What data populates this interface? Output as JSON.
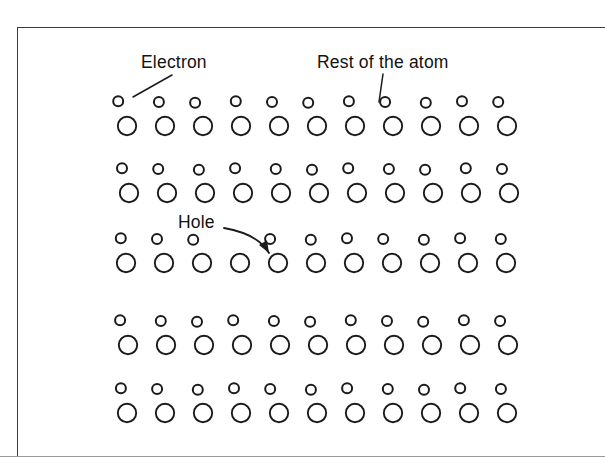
{
  "figure": {
    "kind": "semiconductor-lattice-diagram",
    "background_color": "#ffffff",
    "ink_color": "#1a1a1a",
    "frame_color": "#3a3a3a",
    "frame_bottom_color": "#9a9a9a"
  },
  "labels": {
    "electron": "Electron",
    "rest_of_atom": "Rest of the atom",
    "hole": "Hole"
  },
  "lattice": {
    "columns": 11,
    "rows": 5,
    "electron_radius": 5.0,
    "atom_radius": 9.2,
    "column_step": 38.0,
    "first_atom_x": 127.0,
    "electron_offset_x": -7.0,
    "electron_offset_y": -24.0,
    "row_y": [
      126,
      193,
      263,
      345,
      413
    ],
    "missing_electrons": [
      {
        "row": 2,
        "column": 3
      }
    ],
    "row_x_jitter": [
      0,
      2,
      -1,
      1,
      0
    ]
  },
  "annotations": {
    "electron_leader": {
      "target": "first electron of top row",
      "x1": 172,
      "y1": 75,
      "x2": 133,
      "y2": 97
    },
    "rest_of_atom_leader": {
      "target": "an atom core in the top row",
      "x1": 383,
      "y1": 74,
      "x2": 379,
      "y2": 102
    },
    "hole_arrow": {
      "target": "missing electron in the third row",
      "start_x": 224,
      "start_y": 228,
      "control_x": 258,
      "control_y": 234,
      "end_x": 269,
      "end_y": 253
    }
  }
}
